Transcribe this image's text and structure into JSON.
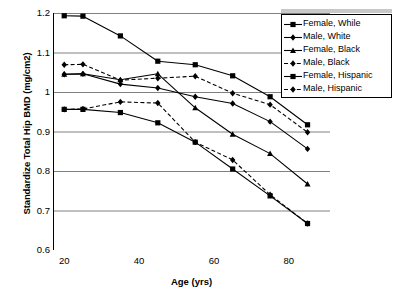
{
  "chart_data": {
    "type": "line",
    "title": "",
    "xlabel": "Age (yrs)",
    "ylabel": "Standardize Total Hip BMD (mg/cm2)",
    "xlim": [
      17,
      91
    ],
    "ylim": [
      0.6,
      1.2
    ],
    "xticks": [
      "20",
      "40",
      "60",
      "80"
    ],
    "xtick_values": [
      20,
      40,
      60,
      80
    ],
    "yticks": [
      "0.6",
      "0.7",
      "0.8",
      "0.9",
      "1",
      "1.1",
      "1.2"
    ],
    "ytick_values": [
      0.6,
      0.7,
      0.8,
      0.9,
      1.0,
      1.1,
      1.2
    ],
    "grid": "horizontal",
    "legend_position": "top-right",
    "x": [
      20,
      25,
      35,
      45,
      55,
      65,
      75,
      85
    ],
    "series": [
      {
        "name": "Female, While",
        "marker": "square",
        "dash": "solid",
        "color": "#000000",
        "values": [
          1.193,
          1.192,
          1.142,
          1.078,
          1.069,
          1.041,
          0.988,
          0.917
        ]
      },
      {
        "name": "Male, White",
        "marker": "diamond",
        "dash": "solid",
        "color": "#000000",
        "values": [
          1.045,
          1.046,
          1.02,
          1.01,
          0.988,
          0.971,
          0.925,
          0.856
        ]
      },
      {
        "name": "Female, Black",
        "marker": "triangle",
        "dash": "solid",
        "color": "#000000",
        "values": [
          1.045,
          1.046,
          1.031,
          1.046,
          0.96,
          0.893,
          0.844,
          0.767
        ]
      },
      {
        "name": "Male, Black",
        "marker": "diamond",
        "dash": "dashed",
        "color": "#000000",
        "values": [
          1.069,
          1.07,
          1.03,
          1.035,
          1.04,
          0.997,
          0.968,
          0.898
        ]
      },
      {
        "name": "Female, Hispanic",
        "marker": "square",
        "dash": "solid",
        "color": "#000000",
        "values": [
          0.956,
          0.956,
          0.948,
          0.922,
          0.873,
          0.805,
          0.737,
          0.667
        ]
      },
      {
        "name": "Male, Hispanic",
        "marker": "diamond",
        "dash": "dashed",
        "color": "#000000",
        "values": [
          0.956,
          0.957,
          0.975,
          0.972,
          0.873,
          0.828,
          0.74,
          0.667
        ]
      }
    ]
  },
  "legend": {
    "items": [
      {
        "label": "Female, While"
      },
      {
        "label": "Male, White"
      },
      {
        "label": "Female, Black"
      },
      {
        "label": "Male, Black"
      },
      {
        "label": "Female, Hispanic"
      },
      {
        "label": "Male, Hispanic"
      }
    ]
  }
}
